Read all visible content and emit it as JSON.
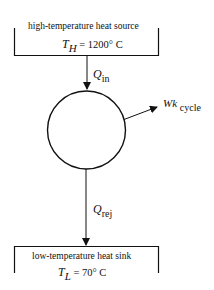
{
  "diagram": {
    "type": "heat-engine-cycle",
    "source": {
      "title": "high-temperature heat source",
      "temp_symbol": "T",
      "temp_subscript": "H",
      "temp_value": "= 1200° C"
    },
    "sink": {
      "title": "low-temperature heat sink",
      "temp_symbol": "T",
      "temp_subscript": "L",
      "temp_value": "= 70° C"
    },
    "flows": {
      "heat_in": {
        "symbol": "Q",
        "subscript": "in"
      },
      "heat_rejected": {
        "symbol": "Q",
        "subscript": "rej"
      },
      "work": {
        "symbol": "Wk",
        "subscript": "cycle"
      }
    },
    "colors": {
      "line": "#111111",
      "background": "#ffffff"
    }
  }
}
